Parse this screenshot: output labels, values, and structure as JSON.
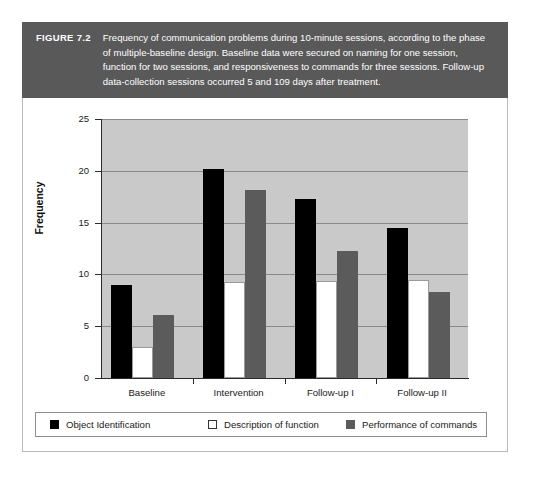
{
  "figure": {
    "number_label": "FIGURE 7.2",
    "caption": "Frequency of communication problems during 10-minute sessions, according to the phase of multiple-baseline design. Baseline data were secured on naming for one session, function for two sessions, and responsiveness to commands for three sessions. Follow-up data-collection sessions occurred 5 and 109 days after treatment."
  },
  "colors": {
    "caption_band": "#595959",
    "plot_background": "#c9c9c9",
    "gridline": "#8a8a8a",
    "series_black": "#000000",
    "series_white": "#ffffff",
    "series_gray": "#5b5b5b",
    "axis": "#2b2b2b"
  },
  "chart_data": {
    "type": "bar",
    "title": "",
    "xlabel": "",
    "ylabel": "Frequency",
    "categories": [
      "Baseline",
      "Intervention",
      "Follow-up I",
      "Follow-up II"
    ],
    "series": [
      {
        "name": "Object Identification",
        "color": "#000000",
        "values": [
          9.0,
          20.2,
          17.3,
          14.5
        ]
      },
      {
        "name": "Description of function",
        "color": "#ffffff",
        "values": [
          3.0,
          9.3,
          9.4,
          9.5
        ]
      },
      {
        "name": "Performance of commands",
        "color": "#5b5b5b",
        "values": [
          6.1,
          18.1,
          12.3,
          8.3
        ]
      }
    ],
    "ylim": [
      0,
      25
    ],
    "yticks": [
      0,
      5,
      10,
      15,
      20,
      25
    ],
    "ytick_labels": [
      "0",
      "5",
      "10",
      "15",
      "20",
      "25"
    ],
    "grid": true,
    "grid_axis": "y",
    "legend_position": "bottom"
  }
}
